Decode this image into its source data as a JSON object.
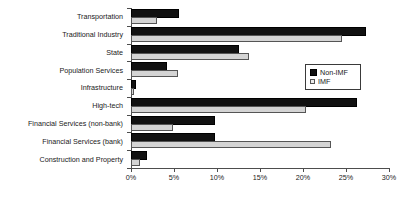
{
  "chart_data": {
    "type": "bar",
    "orientation": "horizontal",
    "title": "",
    "xlabel": "",
    "ylabel": "",
    "xlim": [
      0,
      30
    ],
    "grid": false,
    "legend_position": "right",
    "categories": [
      "Transportation",
      "Traditional Industry",
      "State",
      "Population Services",
      "Infrastructure",
      "High-tech",
      "Financial Services (non-bank)",
      "Financial Services (bank)",
      "Construction and Property"
    ],
    "tick_labels": [
      "0%",
      "5%",
      "10%",
      "15%",
      "20%",
      "25%",
      "30%"
    ],
    "tick_values": [
      0,
      5,
      10,
      15,
      20,
      25,
      30
    ],
    "series": [
      {
        "name": "Non-IMF",
        "color": "#111111",
        "values": [
          5.4,
          27.1,
          12.3,
          4.0,
          0.3,
          26.0,
          9.5,
          9.5,
          1.6
        ]
      },
      {
        "name": "IMF",
        "color": "#d4d4d4",
        "values": [
          3.0,
          24.5,
          13.7,
          5.5,
          0.4,
          20.3,
          4.9,
          23.3,
          1.1
        ]
      }
    ]
  },
  "legend": {
    "entries": [
      {
        "label": "Non-IMF"
      },
      {
        "label": "IMF"
      }
    ]
  }
}
